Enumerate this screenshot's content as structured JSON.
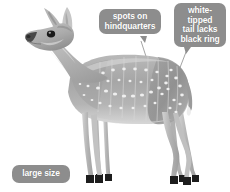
{
  "figure": {
    "background_color": "#ffffff",
    "callout_bubble_color": "#8d8d8d",
    "callout_text_color": "#ffffff",
    "leader_line_color": "#9a9a9a"
  },
  "callouts": {
    "spots": {
      "name": "spots-on-hindquarters-callout",
      "lines": [
        "spots on",
        "hindquarters"
      ],
      "full_text": "spots on hindquarters"
    },
    "tail": {
      "name": "white-tipped-tail-callout",
      "lines": [
        "white-",
        "tipped",
        "tail lacks",
        "black ring"
      ],
      "full_text": "white-tipped tail lacks black ring"
    },
    "size": {
      "name": "large-size-callout",
      "lines": [
        "large size"
      ],
      "full_text": "large size"
    }
  },
  "animal": {
    "body_fill_light": "#cfcfcf",
    "body_fill_mid": "#a8a8a8",
    "body_fill_dark": "#8a8a8a",
    "hoof_color": "#1d1d1d",
    "eye_color": "#1a1a1a",
    "spot_color": "#efefef",
    "spot_count": 46,
    "stripe_count": 8
  }
}
